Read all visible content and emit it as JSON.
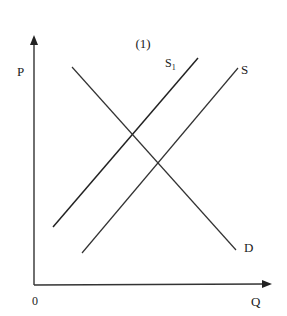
{
  "title": "(1)",
  "axes": {
    "y_label": "P",
    "x_label": "Q",
    "origin_label": "0"
  },
  "curves": {
    "supply_shifted": {
      "label": "S₁",
      "display_label": "S",
      "subscript": "1",
      "from": [
        53,
        227
      ],
      "to": [
        198,
        58
      ]
    },
    "supply": {
      "label": "S",
      "from": [
        82,
        253
      ],
      "to": [
        238,
        68
      ]
    },
    "demand": {
      "label": "D",
      "from": [
        72,
        67
      ],
      "to": [
        236,
        250
      ]
    }
  },
  "colors": {
    "line": "#333333",
    "text": "#222222",
    "background": "#ffffff"
  }
}
